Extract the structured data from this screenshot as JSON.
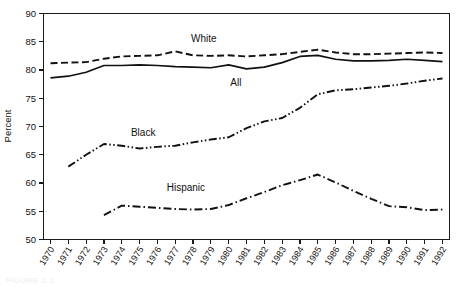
{
  "figure": {
    "caption": "FIGURE 1-1",
    "background": "#ffffff",
    "ink_color": "#111111"
  },
  "chart_data": {
    "type": "line",
    "title": "",
    "subtitle": "",
    "xlabel": "",
    "ylabel": "Percent",
    "xlim": [
      1970,
      1992
    ],
    "ylim": [
      50,
      90
    ],
    "ytick_step": 5,
    "grid": false,
    "legend_position": "inline-annotations",
    "categories": [
      1970,
      1971,
      1972,
      1973,
      1974,
      1975,
      1976,
      1977,
      1978,
      1979,
      1980,
      1981,
      1982,
      1983,
      1984,
      1985,
      1986,
      1987,
      1988,
      1989,
      1990,
      1991,
      1992
    ],
    "xtick_labels": [
      "1970",
      "1971",
      "1972",
      "1973",
      "1974",
      "1975",
      "1976",
      "1977",
      "1978",
      "1979",
      "1980",
      "1981",
      "1982",
      "1983",
      "1984",
      "1985",
      "1986",
      "1987",
      "1988",
      "1989",
      "1990",
      "1991",
      "1992"
    ],
    "ytick_labels": [
      "50",
      "55",
      "60",
      "65",
      "70",
      "75",
      "80",
      "85",
      "90"
    ],
    "ytick_values": [
      50,
      55,
      60,
      65,
      70,
      75,
      80,
      85,
      90
    ],
    "series": [
      {
        "name": "White",
        "label": "White",
        "dash": "dashed",
        "stroke_width": 1.9,
        "dasharray": "7,3.5",
        "label_x": 1978.6,
        "label_y": 85.0,
        "values": [
          81.2,
          81.3,
          81.4,
          82.0,
          82.4,
          82.5,
          82.6,
          83.3,
          82.6,
          82.5,
          82.6,
          82.4,
          82.6,
          82.8,
          83.2,
          83.6,
          83.1,
          82.8,
          82.8,
          82.9,
          83.0,
          83.1,
          83.0
        ]
      },
      {
        "name": "All",
        "label": "All",
        "dash": "solid",
        "stroke_width": 1.7,
        "dasharray": "",
        "label_x": 1980.4,
        "label_y": 77.2,
        "values": [
          78.6,
          78.9,
          79.6,
          80.8,
          80.8,
          80.9,
          80.8,
          80.6,
          80.5,
          80.4,
          80.9,
          80.2,
          80.5,
          81.3,
          82.4,
          82.6,
          81.9,
          81.6,
          81.6,
          81.7,
          81.9,
          81.7,
          81.5
        ]
      },
      {
        "name": "Black",
        "label": "Black",
        "dash": "dash-dot-dot",
        "stroke_width": 1.9,
        "dasharray": "8,2.5,1.5,2.5,1.5,2.5",
        "label_x": 1975.2,
        "label_y": 68.4,
        "values": [
          null,
          62.9,
          65.0,
          66.9,
          66.6,
          66.1,
          66.4,
          66.6,
          67.2,
          67.7,
          68.1,
          69.7,
          70.9,
          71.5,
          73.3,
          75.7,
          76.4,
          76.6,
          76.9,
          77.2,
          77.6,
          78.1,
          78.5
        ]
      },
      {
        "name": "Hispanic",
        "label": "Hispanic",
        "dash": "dash-dot",
        "stroke_width": 1.9,
        "dasharray": "8,3,1.5,3",
        "label_x": 1977.6,
        "label_y": 58.6,
        "values": [
          null,
          null,
          null,
          54.3,
          56.0,
          55.8,
          55.6,
          55.4,
          55.3,
          55.4,
          56.1,
          57.3,
          58.4,
          59.6,
          60.5,
          61.5,
          60.1,
          58.6,
          57.2,
          55.9,
          55.7,
          55.2,
          55.3
        ]
      }
    ]
  }
}
